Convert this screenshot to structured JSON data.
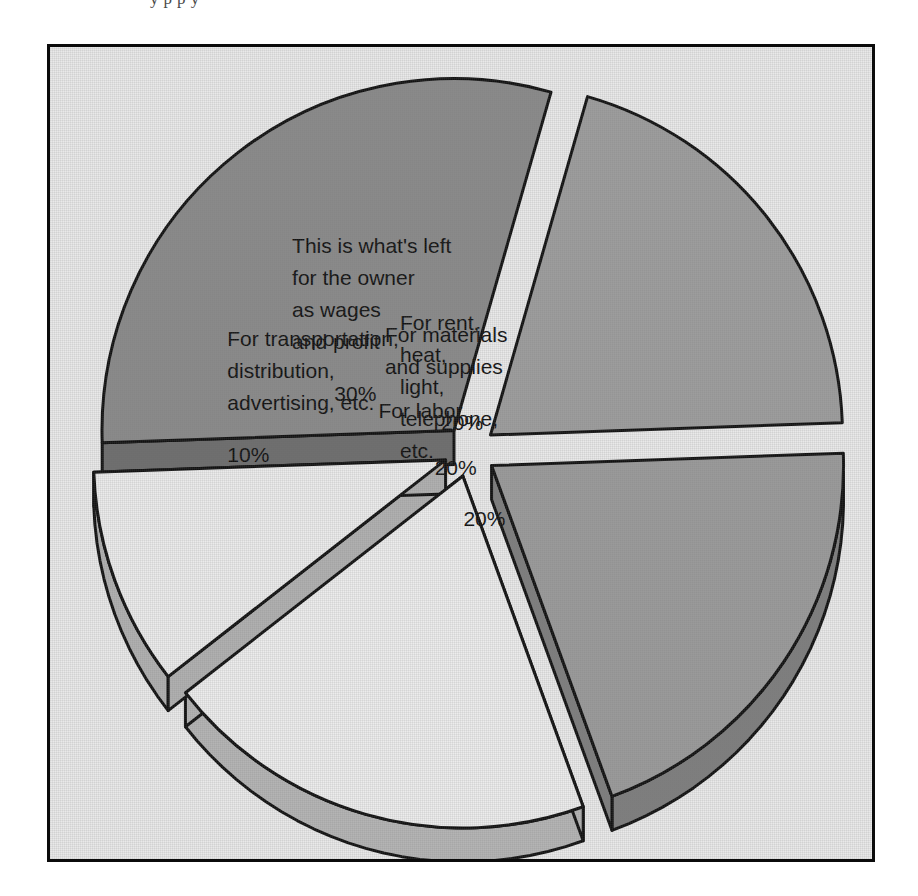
{
  "figure": {
    "background_color": "#e9e9e9",
    "frame_color": "#0b0b0b",
    "scan_sliver_text": "y  p                                                          p  y"
  },
  "chart_data": {
    "type": "pie",
    "title": "",
    "exploded": true,
    "three_d": true,
    "legend_position": "none",
    "grid": false,
    "labels_inside_slices": true,
    "total": 100,
    "unit": "%",
    "categories": [
      "This is what's left for the owner as wages and profit",
      "For materials and supplies",
      "For rent, heat, light, telephone, etc.",
      "For labor",
      "For transportation, distribution, advertising, etc."
    ],
    "values": [
      30,
      20,
      20,
      20,
      10
    ],
    "slices": [
      {
        "id": "owner",
        "lines": [
          "This is what's left",
          "for the owner",
          "as wages",
          "and profit"
        ],
        "percent_text": "30%",
        "value": 30,
        "top_color": "#8a8a8a",
        "side_color": "#6d6d6d",
        "stroke": "#111111"
      },
      {
        "id": "materials",
        "lines": [
          "For materials",
          "and supplies"
        ],
        "percent_text": "20%",
        "value": 20,
        "top_color": "#9d9d9d",
        "side_color": "#848484",
        "stroke": "#111111"
      },
      {
        "id": "rent",
        "lines": [
          "For rent,",
          "heat,",
          "light,",
          "telephone,",
          "etc."
        ],
        "percent_text": "20%",
        "value": 20,
        "top_color": "#9a9a9a",
        "side_color": "#7e7e7e",
        "stroke": "#111111"
      },
      {
        "id": "labor",
        "lines": [
          "For labor"
        ],
        "percent_text": "20%",
        "value": 20,
        "top_color": "#ececec",
        "side_color": "#b4b4b4",
        "stroke": "#111111"
      },
      {
        "id": "transportation",
        "lines": [
          "For transportation,",
          "distribution,",
          "advertising, etc."
        ],
        "percent_text": "10%",
        "value": 10,
        "top_color": "#ebebeb",
        "side_color": "#b0b0b0",
        "stroke": "#111111"
      }
    ]
  }
}
